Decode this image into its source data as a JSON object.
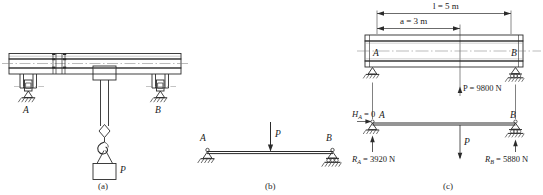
{
  "figure": {
    "type": "engineering-mechanics-beam-diagram",
    "panels": [
      {
        "id": "a",
        "caption": "(a)",
        "description": "overhead crane girder with trolley and suspended load",
        "labels": {
          "support_left": "A",
          "support_right": "B",
          "load": "P"
        }
      },
      {
        "id": "b",
        "caption": "(b)",
        "description": "simply supported beam free body schematic",
        "labels": {
          "support_left": "A",
          "support_right": "B",
          "load": "P"
        }
      },
      {
        "id": "c",
        "caption": "(c)",
        "description": "I-beam with dimensions and computed support reactions",
        "labels": {
          "support_left": "A",
          "support_right": "B",
          "span_dim": "l = 5 m",
          "offset_dim": "a = 3 m",
          "applied_load": "P = 9800 N",
          "horizontal_reaction": "H",
          "horizontal_reaction_sub": "A",
          "horizontal_reaction_value": " = 0",
          "reaction_a": "R",
          "reaction_a_sub": "A",
          "reaction_a_value": " = 3920 N",
          "reaction_b": "R",
          "reaction_b_sub": "B",
          "reaction_b_value": " = 5880 N",
          "load_arrow": "P"
        }
      }
    ],
    "colors": {
      "line": "#2b2b2b",
      "light_line": "#6f6f6f",
      "text": "#1a1a1a",
      "background": "#ffffff"
    }
  }
}
